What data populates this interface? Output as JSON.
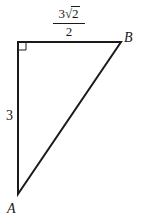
{
  "figure": {
    "type": "right-triangle",
    "vertices": {
      "A": {
        "label": "A",
        "x": 18,
        "y": 194
      },
      "C": {
        "label": "",
        "x": 18,
        "y": 42
      },
      "B": {
        "label": "B",
        "x": 121,
        "y": 42
      }
    },
    "right_angle_at": "C",
    "sides": {
      "AC": {
        "label": "3"
      },
      "CB": {
        "label": "3√2/2",
        "numerator_coef": "3",
        "numerator_radicand": "2",
        "radical": "√",
        "denominator": "2"
      }
    },
    "colors": {
      "stroke": "#1a1a1a",
      "background": "#ffffff"
    }
  }
}
